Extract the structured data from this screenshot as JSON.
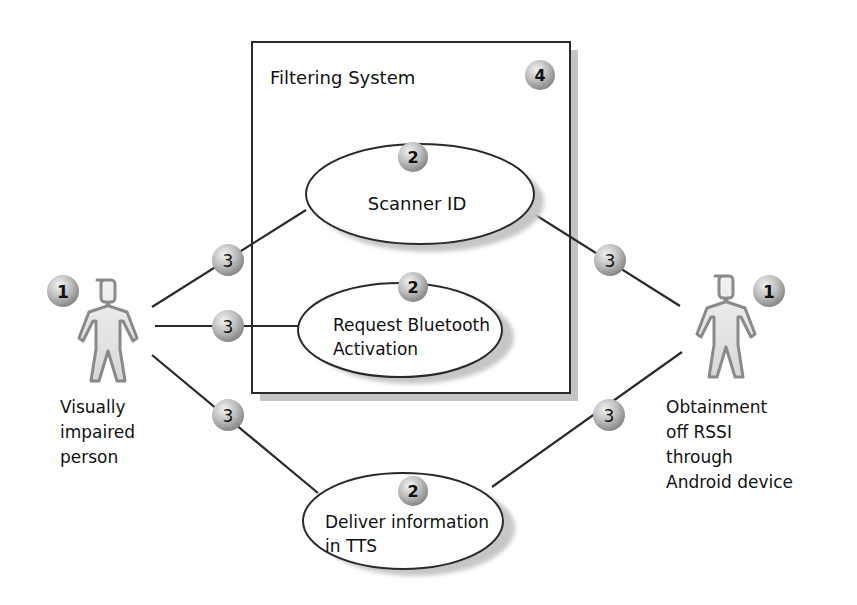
{
  "diagram": {
    "type": "use-case",
    "system_boundary": {
      "title": "Filtering System",
      "badge": "4"
    },
    "actors": [
      {
        "id": "visually-impaired-person",
        "badge": "1",
        "label_lines": [
          "Visually",
          "impaired",
          "person"
        ]
      },
      {
        "id": "android-device",
        "badge": "1",
        "label_lines": [
          "Obtainment",
          "off RSSI",
          "through",
          "Android device"
        ]
      }
    ],
    "use_cases": [
      {
        "id": "scanner-id",
        "badge": "2",
        "label_lines": [
          "Scanner ID"
        ]
      },
      {
        "id": "request-bluetooth-activation",
        "badge": "2",
        "label_lines": [
          "Request Bluetooth",
          "Activation"
        ]
      },
      {
        "id": "deliver-information-tts",
        "badge": "2",
        "label_lines": [
          "Deliver information",
          "in TTS"
        ]
      }
    ],
    "associations": [
      {
        "from": "visually-impaired-person",
        "to": "scanner-id",
        "badge": "3"
      },
      {
        "from": "visually-impaired-person",
        "to": "request-bluetooth-activation",
        "badge": "3"
      },
      {
        "from": "visually-impaired-person",
        "to": "deliver-information-tts",
        "badge": "3"
      },
      {
        "from": "android-device",
        "to": "scanner-id",
        "badge": "3"
      },
      {
        "from": "android-device",
        "to": "deliver-information-tts",
        "badge": "3"
      }
    ],
    "colors": {
      "line": "#2a2a2a",
      "shadow": "#bdbdbd",
      "badge_light": "#e6e6e6",
      "badge_dark": "#8c8c8c",
      "actor_fill": "#e8e8e8",
      "actor_stroke": "#8a8a8a"
    }
  }
}
